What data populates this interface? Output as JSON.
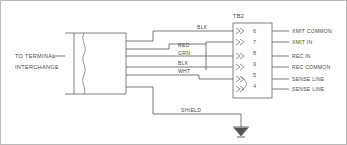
{
  "diagram": {
    "source_label_line1": "TO TERMINAL",
    "source_label_line2": "INTERCHANGE",
    "terminal_block_label": "TB2",
    "shield_label": "SHIELD",
    "ground_symbol_name": "earth-ground",
    "colors": {
      "background": "#ffffff",
      "line": "#555555",
      "box": "#6b6b6b",
      "text": "#4a4a4a",
      "border": "#b9b9b9"
    },
    "wires": [
      {
        "color_code": "BLK",
        "pin": "6",
        "signal": "XMIT COMMON"
      },
      {
        "color_code": "RED",
        "pin": "7",
        "signal": "XMIT IN"
      },
      {
        "color_code": "GRN",
        "pin": "8",
        "signal": "REC IN"
      },
      {
        "color_code": "BLK",
        "pin": "9",
        "signal": "REC COMMON"
      },
      {
        "color_code": "WHT",
        "pin": "5",
        "signal": "SENSE LINE"
      },
      {
        "color_code": "",
        "pin": "4",
        "signal": "SENSE LINE"
      }
    ],
    "pins": [
      "6",
      "7",
      "8",
      "9",
      "5",
      "4"
    ],
    "signals": [
      "XMIT COMMON",
      "XMIT IN",
      "REC IN",
      "REC COMMON",
      "SENSE LINE",
      "SENSE LINE"
    ],
    "wire_colors": [
      "BLK",
      "RED",
      "GRN",
      "BLK",
      "WHT"
    ]
  }
}
